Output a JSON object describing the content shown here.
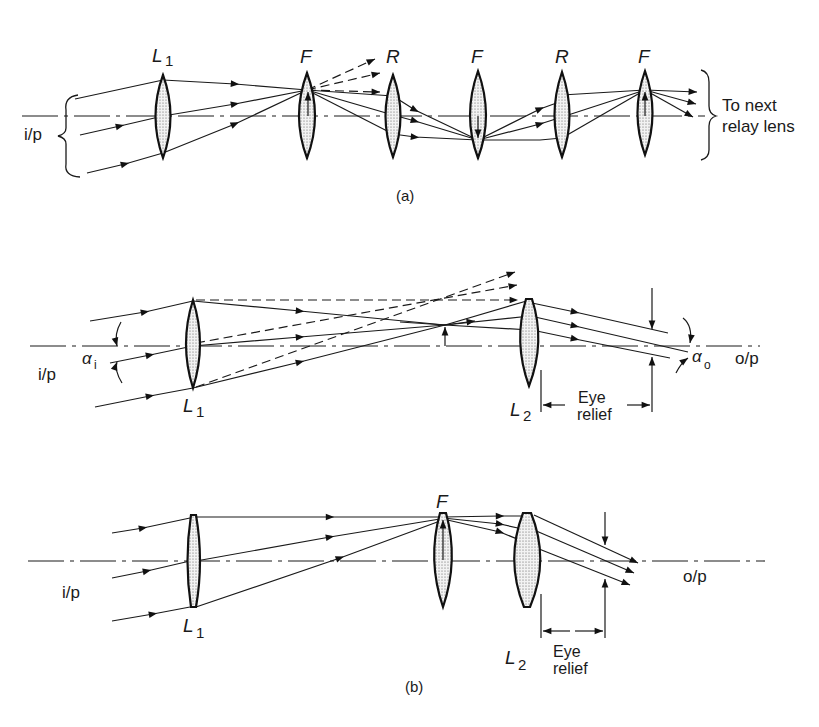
{
  "diagram_a": {
    "caption": "(a)",
    "input_label": "i/p",
    "output_label_line1": "To next",
    "output_label_line2": "relay lens",
    "lenses": [
      {
        "label": "L",
        "subscript": "1",
        "role": "input lens"
      },
      {
        "label": "F",
        "role": "field lens"
      },
      {
        "label": "R",
        "role": "relay lens"
      },
      {
        "label": "F",
        "role": "field lens"
      },
      {
        "label": "R",
        "role": "relay lens"
      },
      {
        "label": "F",
        "role": "field lens"
      }
    ]
  },
  "diagram_b": {
    "caption": "(b)",
    "top": {
      "input_label": "i/p",
      "output_label": "o/p",
      "lens1": {
        "label": "L",
        "subscript": "1"
      },
      "lens2": {
        "label": "L",
        "subscript": "2"
      },
      "angle_in": {
        "symbol": "α",
        "subscript": "i"
      },
      "angle_out": {
        "symbol": "α",
        "subscript": "o"
      },
      "eye_relief_line1": "Eye",
      "eye_relief_line2": "relief"
    },
    "bottom": {
      "input_label": "i/p",
      "output_label": "o/p",
      "lens1": {
        "label": "L",
        "subscript": "1"
      },
      "field_lens": {
        "label": "F"
      },
      "lens2": {
        "label": "L",
        "subscript": "2"
      },
      "eye_relief_line1": "Eye",
      "eye_relief_line2": "relief"
    }
  }
}
